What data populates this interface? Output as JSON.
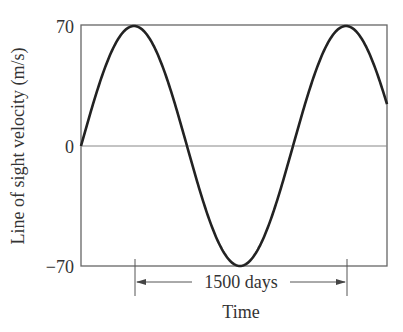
{
  "chart_data": {
    "type": "line",
    "title": "",
    "xlabel": "Time",
    "ylabel": "Line of sight velocity (m/s)",
    "yticks": [
      "70",
      "0",
      "-70"
    ],
    "ylim": [
      -70,
      70
    ],
    "grid": false,
    "annotation": "1500 days",
    "period_days": 1500,
    "amplitude": 70,
    "series": [
      {
        "name": "radial velocity",
        "description": "sinusoid starting at 0, amplitude 70 m/s, period 1500 days",
        "x_days": [
          0,
          375,
          750,
          1125,
          1500,
          1875,
          2165
        ],
        "y": [
          0,
          70,
          0,
          -70,
          0,
          70,
          33
        ]
      }
    ]
  },
  "labels": {
    "y_top": "70",
    "y_zero": "0",
    "y_bottom": "−70",
    "ylabel": "Line of sight velocity (m/s)",
    "xlabel": "Time",
    "period": "1500 days"
  }
}
